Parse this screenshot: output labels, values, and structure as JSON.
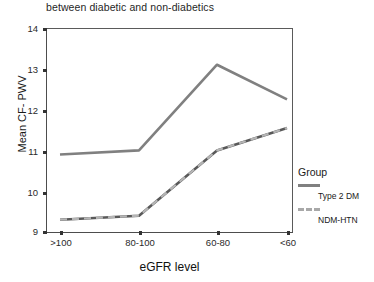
{
  "chart_data": {
    "type": "line",
    "title": "between diabetic and non-diabetics",
    "xlabel": "eGFR level",
    "ylabel": "Mean CF- PWV",
    "categories": [
      ">100",
      "80-100",
      "60-80",
      "<60"
    ],
    "ytick_labels": [
      "14",
      "13",
      "12",
      "11",
      "10",
      "9"
    ],
    "ylim": [
      9,
      14
    ],
    "grid": false,
    "legend_position": "right",
    "legend_title": "Group",
    "series": [
      {
        "name": "Type 2 DM",
        "values": [
          10.9,
          11.0,
          13.1,
          12.25
        ],
        "style": "solid",
        "color": "#808080"
      },
      {
        "name": "NDM-HTN",
        "values": [
          9.3,
          9.4,
          11.0,
          11.55
        ],
        "style": "dashed",
        "color": "#a8a8a8"
      }
    ]
  },
  "axis": {
    "y_title": "Mean CF- PWV",
    "x_title": "eGFR level",
    "y_ticks": [
      {
        "label": "14"
      },
      {
        "label": "13"
      },
      {
        "label": "12"
      },
      {
        "label": "11"
      },
      {
        "label": "10"
      },
      {
        "label": "9"
      }
    ],
    "x_ticks": [
      {
        "label": ">100"
      },
      {
        "label": "80-100"
      },
      {
        "label": "60-80"
      },
      {
        "label": "<60"
      }
    ]
  },
  "legend": {
    "title": "Group",
    "items": [
      {
        "label": "Type 2 DM",
        "style": "solid"
      },
      {
        "label": "NDM-HTN",
        "style": "dashed"
      }
    ]
  },
  "colors": {
    "series_solid": "#808080",
    "series_dashed_light": "#a8a8a8",
    "series_dashed_dark": "#595959",
    "axis": "#4d4d4d",
    "text": "#1a1a1a",
    "background": "#ffffff"
  }
}
